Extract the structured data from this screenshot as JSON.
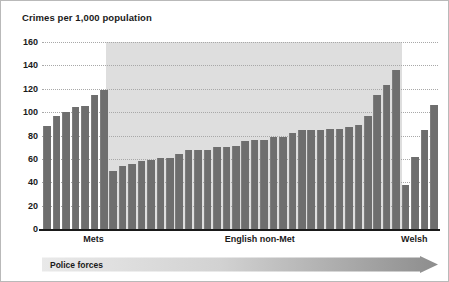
{
  "chart_data": {
    "type": "bar",
    "title": "Crimes per 1,000 population",
    "xlabel": "Police forces",
    "ylabel": "Crimes per 1,000 population",
    "ylim": [
      0,
      160
    ],
    "yticks": [
      0,
      20,
      40,
      60,
      80,
      100,
      120,
      140,
      160
    ],
    "grid": true,
    "legend": false,
    "bar_color": "#6e6e6e",
    "shaded_band_color": "#dedede",
    "shaded_band_group": "English non-Met",
    "groups": [
      {
        "name": "Mets",
        "label_x_pct": 13,
        "values": [
          88,
          97,
          100,
          104,
          105,
          115,
          119
        ]
      },
      {
        "name": "English non-Met",
        "label_x_pct": 55,
        "values": [
          50,
          54,
          56,
          58,
          59,
          61,
          61,
          64,
          68,
          68,
          68,
          70,
          70,
          71,
          75,
          76,
          76,
          79,
          79,
          82,
          85,
          85,
          85,
          86,
          86,
          87,
          89,
          97,
          115,
          123,
          136
        ]
      },
      {
        "name": "Welsh",
        "label_x_pct": 94,
        "values": [
          38,
          62,
          85,
          106
        ]
      }
    ]
  },
  "arrow": {
    "label": "Police forces",
    "gradient_start": "#e8e8e8",
    "gradient_end": "#8f8f8f"
  }
}
